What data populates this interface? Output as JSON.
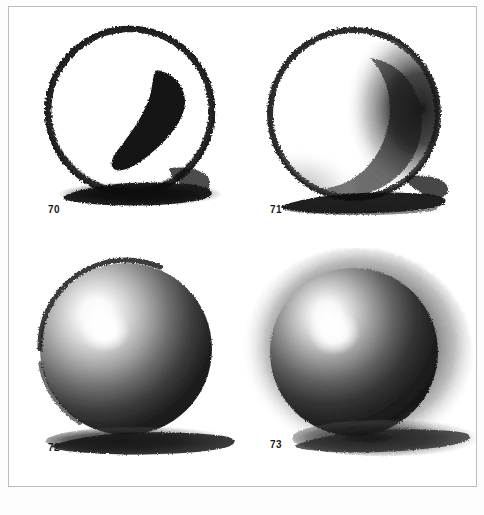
{
  "page": {
    "type": "scanned-book-plate",
    "background_color": "#ffffff",
    "border_color": "#b9bcc0",
    "media_color": "#111111"
  },
  "figures": [
    {
      "number": "70",
      "caption": "70",
      "title": "Outline circle with cast shadow",
      "stage": "stage-1-contour",
      "description": "Rough charcoal contour circle, dark crescent core shadow at right interior, heavy cast shadow beneath",
      "shading": "none",
      "has_highlight": false,
      "has_cast_shadow": true,
      "tone_darkest": "#0d0d0d",
      "tone_lightest": "#ffffff"
    },
    {
      "number": "71",
      "caption": "71",
      "title": "Crescent core shadow blocked in",
      "stage": "stage-2-core-shadow",
      "description": "Contour circle with soft crescent core shadow laid in on the right, body still mostly white paper, cast shadow below",
      "shading": "partial",
      "has_highlight": false,
      "has_cast_shadow": true,
      "tone_darkest": "#151515",
      "tone_lightest": "#ffffff"
    },
    {
      "number": "72",
      "caption": "72",
      "title": "Full modelling with highlight",
      "stage": "stage-3-full-modelling",
      "description": "Sphere fully modelled in tone, bright highlight upper left, core shadow right and lower, reflected light along lower right rim, cast shadow to the right",
      "shading": "full",
      "has_highlight": true,
      "highlight_position": "upper-left",
      "has_cast_shadow": true,
      "tone_darkest": "#131313",
      "tone_lightest": "#ffffff"
    },
    {
      "number": "73",
      "caption": "73",
      "title": "Sphere with toned background",
      "stage": "stage-4-background-tone",
      "description": "Fully modelled sphere set against a dark charcoal background halo, highlight upper left, long cast shadow to the lower right",
      "shading": "full",
      "has_highlight": true,
      "highlight_position": "upper-left",
      "has_cast_shadow": true,
      "has_background_tone": true,
      "tone_darkest": "#101010",
      "tone_lightest": "#ffffff"
    }
  ]
}
